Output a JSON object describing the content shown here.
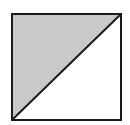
{
  "diagram": {
    "shape": "square-split-by-diagonal",
    "square": {
      "x": 12,
      "y": 14,
      "width": 109,
      "height": 106
    },
    "diagonal": {
      "from": "bottom-left",
      "to": "top-right"
    },
    "shaded_region": "upper-left-triangle",
    "unshaded_region": "lower-right-triangle",
    "colors": {
      "shaded_fill": "#c9c9c9",
      "unshaded_fill": "#ffffff",
      "stroke": "#1a1a1a",
      "background": "#ffffff"
    }
  }
}
